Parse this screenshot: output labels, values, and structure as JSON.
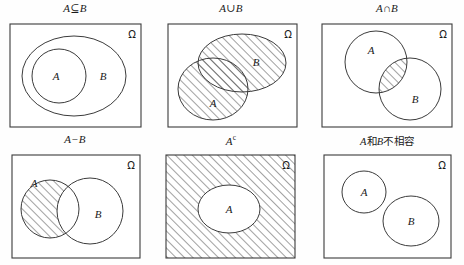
{
  "figure": {
    "kind": "venn-diagram-grid",
    "rows": 2,
    "cols": 3,
    "stroke_color": "#3b3b3b",
    "hatch_color": "#2e2e2e",
    "background": "#ffffff",
    "universe_symbol": "Ω"
  },
  "panels": [
    {
      "id": "subset",
      "title": "A⊆B",
      "title_parts": {
        "a": "A",
        "op": "⊆",
        "b": "B"
      },
      "omega": "Ω",
      "labels": {
        "a": "A",
        "b": "B"
      },
      "shaded": "none",
      "description": "A contained in B"
    },
    {
      "id": "union",
      "title": "A∪B",
      "title_parts": {
        "a": "A",
        "op": "∪",
        "b": "B"
      },
      "omega": "Ω",
      "labels": {
        "a": "A",
        "b": "B"
      },
      "shaded": "both-ellipses",
      "description": "Union of A and B hatched"
    },
    {
      "id": "intersection",
      "title": "A∩B",
      "title_parts": {
        "a": "A",
        "op": "∩",
        "b": "B"
      },
      "omega": "Ω",
      "labels": {
        "a": "A",
        "b": "B"
      },
      "shaded": "overlap-only",
      "description": "Intersection of A and B hatched"
    },
    {
      "id": "difference",
      "title": "A−B",
      "title_parts": {
        "a": "A",
        "op": "−",
        "b": "B"
      },
      "omega": "Ω",
      "labels": {
        "a": "A",
        "b": "B"
      },
      "shaded": "a-minus-b",
      "description": "A without B hatched"
    },
    {
      "id": "complement",
      "title_parts": {
        "a": "A",
        "sup": "c"
      },
      "title": "Ac",
      "omega": "Ω",
      "labels": {
        "a": "A"
      },
      "shaded": "outside-a",
      "description": "Complement of A hatched"
    },
    {
      "id": "disjoint",
      "title": "A和B不相容",
      "title_parts": {
        "a": "A",
        "mid": "和",
        "b": "B",
        "tail": "不相容"
      },
      "omega": "Ω",
      "labels": {
        "a": "A",
        "b": "B"
      },
      "shaded": "none",
      "description": "A and B mutually exclusive"
    }
  ]
}
